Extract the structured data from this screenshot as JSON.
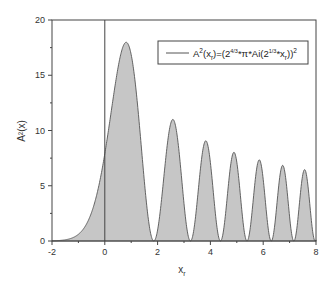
{
  "chart_data": {
    "type": "area",
    "title": "",
    "xlabel": "x",
    "xlabel_subscript": "r",
    "ylabel": "A²(x)",
    "xlim": [
      -2,
      8
    ],
    "ylim": [
      0,
      20
    ],
    "x_ticks": [
      -2,
      0,
      2,
      4,
      6,
      8
    ],
    "y_ticks": [
      0,
      5,
      10,
      15,
      20
    ],
    "grid": false,
    "vertical_reference_line_x": 0,
    "legend": {
      "position": "upper-right",
      "entries": [
        {
          "label": "A²(xr)=(2^(4/3)*π*Ai(2^(1/3)*xr))²"
        }
      ]
    },
    "formula": "A2(x) = (2^(4/3) * pi * Ai(-2^(1/3) * x))^2",
    "series": [
      {
        "name": "A²(xr)",
        "fill_color": "#c6c6c6",
        "line_color": "#555555",
        "points": [
          [
            -2.0,
            0.004
          ],
          [
            -1.5,
            0.06
          ],
          [
            -1.0,
            0.43
          ],
          [
            -0.5,
            2.1
          ],
          [
            0.0,
            7.9
          ],
          [
            0.4,
            14.3
          ],
          [
            0.81,
            17.98
          ],
          [
            1.2,
            14.8
          ],
          [
            1.5,
            7.4
          ],
          [
            1.856,
            0.0
          ],
          [
            2.2,
            5.9
          ],
          [
            2.58,
            11.0
          ],
          [
            2.9,
            6.2
          ],
          [
            3.245,
            0.0
          ],
          [
            3.83,
            9.07
          ],
          [
            4.382,
            0.0
          ],
          [
            4.89,
            8.03
          ],
          [
            5.387,
            0.0
          ],
          [
            5.85,
            7.34
          ],
          [
            6.305,
            0.0
          ],
          [
            6.74,
            6.85
          ],
          [
            7.161,
            0.0
          ],
          [
            7.57,
            6.46
          ],
          [
            7.969,
            0.0
          ],
          [
            8.0,
            0.01
          ]
        ],
        "peaks": [
          {
            "x": 0.81,
            "y": 17.98
          },
          {
            "x": 2.58,
            "y": 11.0
          },
          {
            "x": 3.83,
            "y": 9.07
          },
          {
            "x": 4.89,
            "y": 8.03
          },
          {
            "x": 5.85,
            "y": 7.34
          },
          {
            "x": 6.74,
            "y": 6.85
          },
          {
            "x": 7.57,
            "y": 6.46
          }
        ],
        "zeros": [
          1.856,
          3.245,
          4.382,
          5.387,
          6.305,
          7.161,
          7.969
        ]
      }
    ]
  },
  "layout": {
    "plot": {
      "left": 52,
      "right": 316,
      "top": 20,
      "bottom": 241
    }
  },
  "axes": {
    "x_tick_labels": [
      "-2",
      "0",
      "2",
      "4",
      "6",
      "8"
    ],
    "y_tick_labels": [
      "0",
      "5",
      "10",
      "15",
      "20"
    ],
    "xlabel_main": "x",
    "xlabel_sub": "r",
    "ylabel": "A²(x)"
  },
  "legend": {
    "label_parts": {
      "a": "A",
      "sq1": "2",
      "open": "(x",
      "sub1": "r",
      "mid": ")=(2",
      "exp1": "4/3",
      "mid2": "*π*Ai(2",
      "exp2": "1/3",
      "mid3": "*x",
      "sub2": "r",
      "close": "))",
      "sq2": "2"
    }
  }
}
